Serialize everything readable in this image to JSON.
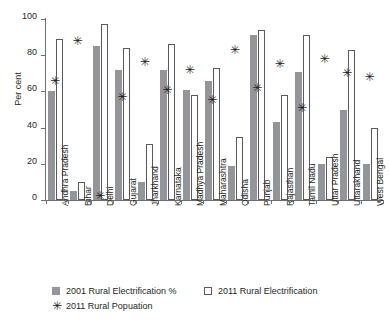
{
  "chart_data": {
    "type": "bar",
    "title": "",
    "xlabel": "",
    "ylabel": "Per cent",
    "ylim": [
      0,
      100
    ],
    "yticks": [
      0,
      20,
      40,
      60,
      80,
      100
    ],
    "grid": false,
    "legend_position": "bottom-left",
    "categories": [
      "Andhra Pradesh",
      "Bihar",
      "Delhi",
      "Gujarat",
      "Jharkhand",
      "Karnataka",
      "Madhya Pradesh",
      "Maharashtra",
      "Odisha",
      "Punjab",
      "Rajasthan",
      "Tamil Nadu",
      "Uttar Pradesh",
      "Uttarakhand",
      "West Bengal"
    ],
    "series": [
      {
        "name": "2001 Rural Electrification %",
        "marker": "filled-square",
        "color": "#939598",
        "values": [
          60,
          5,
          85,
          72,
          10,
          72,
          61,
          66,
          19,
          91,
          43,
          71,
          20,
          50,
          20
        ]
      },
      {
        "name": "2011 Rural Electrification",
        "marker": "open-square",
        "color": "#ffffff",
        "values": [
          89,
          10,
          97,
          84,
          31,
          86,
          58,
          73,
          35,
          94,
          58,
          91,
          24,
          83,
          40
        ]
      },
      {
        "name": "2011 Rural Popuation",
        "marker": "asterisk",
        "color": "#231f20",
        "values": [
          66,
          88,
          2,
          57,
          76,
          61,
          72,
          55,
          83,
          62,
          75,
          51,
          78,
          70,
          68
        ]
      }
    ]
  },
  "legend": {
    "items": [
      {
        "label": "2001 Rural Electrification %",
        "marker": "filled-square"
      },
      {
        "label": "2011 Rural Electrification",
        "marker": "open-square"
      },
      {
        "label": "2011 Rural Popuation",
        "marker": "asterisk"
      }
    ]
  },
  "glyphs": {
    "asterisk": "✳"
  }
}
